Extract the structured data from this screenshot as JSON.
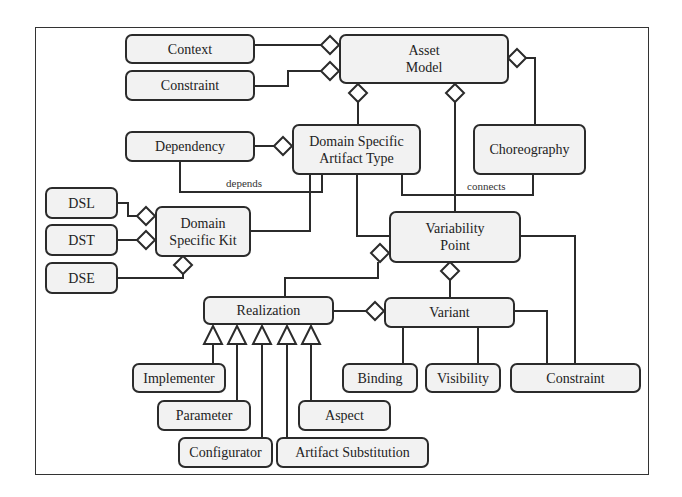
{
  "diagram": {
    "type": "UML class diagram",
    "nodes": [
      {
        "id": "context",
        "label": "Context"
      },
      {
        "id": "constraint_top",
        "label": "Constraint"
      },
      {
        "id": "asset_model",
        "label": "Asset Model",
        "line1": "Asset",
        "line2": "Model"
      },
      {
        "id": "dependency",
        "label": "Dependency"
      },
      {
        "id": "dsat",
        "label": "Domain Specific Artifact Type",
        "line1": "Domain Specific",
        "line2": "Artifact Type"
      },
      {
        "id": "choreography",
        "label": "Choreography"
      },
      {
        "id": "dsl",
        "label": "DSL"
      },
      {
        "id": "dst",
        "label": "DST"
      },
      {
        "id": "dse",
        "label": "DSE"
      },
      {
        "id": "dsk",
        "label": "Domain Specific Kit",
        "line1": "Domain",
        "line2": "Specific Kit"
      },
      {
        "id": "variability_point",
        "label": "Variability Point",
        "line1": "Variability",
        "line2": "Point"
      },
      {
        "id": "realization",
        "label": "Realization"
      },
      {
        "id": "variant",
        "label": "Variant"
      },
      {
        "id": "implementer",
        "label": "Implementer"
      },
      {
        "id": "parameter",
        "label": "Parameter"
      },
      {
        "id": "configurator",
        "label": "Configurator"
      },
      {
        "id": "artifact_substitution",
        "label": "Artifact Substitution"
      },
      {
        "id": "aspect",
        "label": "Aspect"
      },
      {
        "id": "binding",
        "label": "Binding"
      },
      {
        "id": "visibility",
        "label": "Visibility"
      },
      {
        "id": "constraint_bottom",
        "label": "Constraint"
      }
    ],
    "edge_labels": {
      "depends": "depends",
      "connects": "connects"
    },
    "edges": [
      {
        "from": "context",
        "to": "asset_model",
        "kind": "aggregation"
      },
      {
        "from": "constraint_top",
        "to": "asset_model",
        "kind": "aggregation"
      },
      {
        "from": "dsat",
        "to": "asset_model",
        "kind": "aggregation"
      },
      {
        "from": "variability_point",
        "to": "asset_model",
        "kind": "aggregation"
      },
      {
        "from": "choreography",
        "to": "asset_model",
        "kind": "aggregation"
      },
      {
        "from": "dependency",
        "to": "dsat",
        "kind": "aggregation"
      },
      {
        "from": "dependency",
        "to": "dsat",
        "kind": "association",
        "label": "depends"
      },
      {
        "from": "dsat",
        "to": "choreography",
        "kind": "association",
        "label": "connects"
      },
      {
        "from": "dsk",
        "to": "dsat",
        "kind": "association"
      },
      {
        "from": "dsat",
        "to": "variability_point",
        "kind": "association"
      },
      {
        "from": "dsl",
        "to": "dsk",
        "kind": "aggregation"
      },
      {
        "from": "dst",
        "to": "dsk",
        "kind": "aggregation"
      },
      {
        "from": "dse",
        "to": "dsk",
        "kind": "aggregation"
      },
      {
        "from": "realization",
        "to": "variability_point",
        "kind": "aggregation"
      },
      {
        "from": "variant",
        "to": "variability_point",
        "kind": "aggregation"
      },
      {
        "from": "realization",
        "to": "variant",
        "kind": "aggregation"
      },
      {
        "from": "implementer",
        "to": "realization",
        "kind": "generalization"
      },
      {
        "from": "parameter",
        "to": "realization",
        "kind": "generalization"
      },
      {
        "from": "configurator",
        "to": "realization",
        "kind": "generalization"
      },
      {
        "from": "artifact_substitution",
        "to": "realization",
        "kind": "generalization"
      },
      {
        "from": "aspect",
        "to": "realization",
        "kind": "generalization"
      },
      {
        "from": "variant",
        "to": "binding",
        "kind": "association"
      },
      {
        "from": "variant",
        "to": "visibility",
        "kind": "association"
      },
      {
        "from": "variant",
        "to": "constraint_bottom",
        "kind": "association"
      },
      {
        "from": "variability_point",
        "to": "constraint_bottom",
        "kind": "association"
      }
    ]
  }
}
